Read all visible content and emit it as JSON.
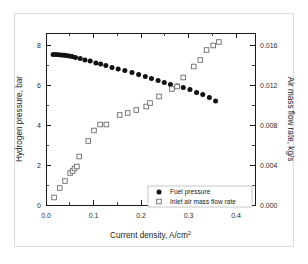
{
  "figure": {
    "border_color": "#dcdcdc",
    "background": "#ffffff"
  },
  "chart_data": {
    "type": "scatter",
    "title": "",
    "xlabel": "Current density, A/cm",
    "xlabel_sup": "2",
    "ylabel_left": "Hydrogen pressure, bar",
    "ylabel_right": "Air mass flow rate, kg/s",
    "xlim": [
      0.0,
      0.44
    ],
    "ylim_left": [
      0,
      8.6
    ],
    "ylim_right": [
      0.0,
      0.0172
    ],
    "xticks": [
      0.0,
      0.1,
      0.2,
      0.3,
      0.4
    ],
    "xticklabels": [
      "0.0",
      "0.1",
      "0.2",
      "0.3",
      "0.4"
    ],
    "yticks_left": [
      0,
      2,
      4,
      6,
      8
    ],
    "yticklabels_left": [
      "0",
      "2",
      "4",
      "6",
      "8"
    ],
    "yticks_right": [
      0.0,
      0.004,
      0.008,
      0.012,
      0.016
    ],
    "yticklabels_right": [
      "0.000",
      "0.004",
      "0.008",
      "0.012",
      "0.016"
    ],
    "grid": false,
    "legend_position": "lower right",
    "series": [
      {
        "name": "Fuel pressure",
        "marker": "filled-circle",
        "color": "#111111",
        "axis": "left",
        "x": [
          0.015,
          0.021,
          0.027,
          0.032,
          0.038,
          0.043,
          0.049,
          0.055,
          0.062,
          0.072,
          0.082,
          0.093,
          0.105,
          0.115,
          0.126,
          0.139,
          0.152,
          0.166,
          0.181,
          0.195,
          0.209,
          0.222,
          0.236,
          0.249,
          0.262,
          0.276,
          0.289,
          0.303,
          0.317,
          0.33,
          0.344,
          0.357
        ],
        "y": [
          7.52,
          7.52,
          7.51,
          7.5,
          7.49,
          7.47,
          7.45,
          7.42,
          7.38,
          7.33,
          7.25,
          7.2,
          7.1,
          7.05,
          6.98,
          6.88,
          6.8,
          6.72,
          6.63,
          6.53,
          6.42,
          6.32,
          6.22,
          6.12,
          6.03,
          5.95,
          5.88,
          5.78,
          5.62,
          5.52,
          5.38,
          5.2
        ]
      },
      {
        "name": "Inlet air mass flow rate",
        "marker": "open-square",
        "color": "#6b6b6b",
        "axis": "right",
        "x": [
          0.017,
          0.029,
          0.04,
          0.051,
          0.056,
          0.06,
          0.065,
          0.07,
          0.089,
          0.101,
          0.114,
          0.127,
          0.155,
          0.172,
          0.19,
          0.211,
          0.219,
          0.238,
          0.265,
          0.276,
          0.289,
          0.311,
          0.325,
          0.338,
          0.352,
          0.364
        ],
        "y": [
          0.00075,
          0.0017,
          0.0024,
          0.0032,
          0.0034,
          0.00365,
          0.00385,
          0.00485,
          0.0064,
          0.00745,
          0.00805,
          0.00805,
          0.009,
          0.0092,
          0.0095,
          0.00985,
          0.0102,
          0.01085,
          0.0116,
          0.01185,
          0.01275,
          0.01385,
          0.0145,
          0.0155,
          0.01595,
          0.0163
        ]
      }
    ]
  }
}
